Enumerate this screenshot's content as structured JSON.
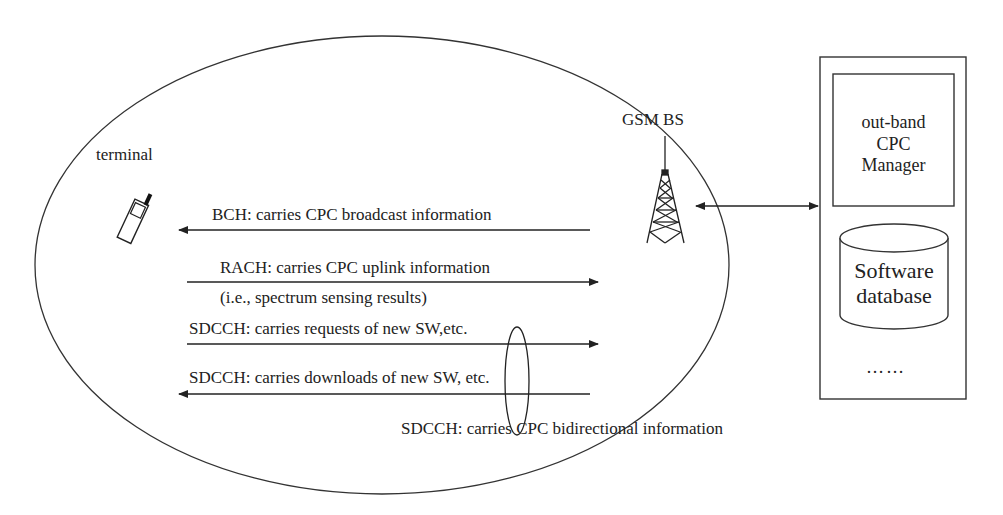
{
  "diagram": {
    "nodes": {
      "terminal": {
        "label": "terminal"
      },
      "base_station": {
        "label": "GSM BS"
      },
      "cpc_manager": {
        "label_lines": [
          "out-band",
          "CPC",
          "Manager"
        ]
      },
      "software_database": {
        "label_lines": [
          "Software",
          "database"
        ]
      },
      "ellipsis": {
        "label": "……"
      }
    },
    "channels": [
      {
        "label": "BCH: carries CPC broadcast information",
        "direction": "BS-to-terminal"
      },
      {
        "label": "RACH: carries CPC uplink information",
        "sublabel": "(i.e., spectrum sensing results)",
        "direction": "terminal-to-BS"
      },
      {
        "label": "SDCCH: carries requests of new SW,etc.",
        "direction": "terminal-to-BS"
      },
      {
        "label": "SDCCH: carries downloads of new SW, etc.",
        "direction": "BS-to-terminal"
      }
    ],
    "bidirectional_note": "SDCCH: carries CPC bidirectional information",
    "colors": {
      "stroke": "#222222",
      "background": "#ffffff"
    }
  }
}
